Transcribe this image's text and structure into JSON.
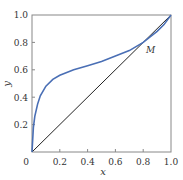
{
  "chart_data": {
    "type": "line",
    "title": "",
    "xlabel": "x",
    "ylabel": "y",
    "xlim": [
      0,
      1
    ],
    "ylim": [
      0,
      1
    ],
    "grid": false,
    "x_ticks": [
      "0",
      "0.2",
      "0.4",
      "0.6",
      "0.8",
      "1.0"
    ],
    "y_ticks": [
      "0.2",
      "0.4",
      "0.6",
      "0.8",
      "1.0"
    ],
    "series": [
      {
        "name": "equilibrium curve",
        "color": "#4a6fb5",
        "x": [
          0,
          0.01,
          0.02,
          0.04,
          0.06,
          0.1,
          0.15,
          0.2,
          0.3,
          0.4,
          0.5,
          0.6,
          0.7,
          0.8,
          0.85,
          0.9,
          0.95,
          1.0
        ],
        "y": [
          0,
          0.18,
          0.26,
          0.35,
          0.41,
          0.48,
          0.53,
          0.56,
          0.6,
          0.63,
          0.66,
          0.7,
          0.74,
          0.8,
          0.84,
          0.88,
          0.93,
          1.0
        ]
      },
      {
        "name": "diagonal y = x",
        "color": "#222222",
        "x": [
          0,
          1
        ],
        "y": [
          0,
          1
        ]
      }
    ],
    "annotations": [
      {
        "text": "M",
        "x": 0.82,
        "y": 0.82
      }
    ]
  }
}
